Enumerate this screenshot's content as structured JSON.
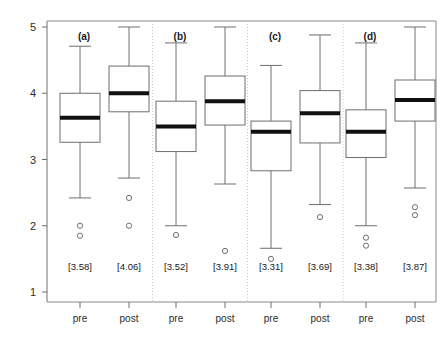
{
  "chart_data": {
    "type": "box",
    "title": "",
    "xlabel": "",
    "ylabel": "",
    "ylim": [
      1,
      5
    ],
    "yticks": [
      1,
      2,
      3,
      4,
      5
    ],
    "ytick_labels": [
      "1",
      "2",
      "3",
      "4",
      "5"
    ],
    "grid": false,
    "legend": "none",
    "panel_labels": [
      "(a)",
      "(b)",
      "(c)",
      "(d)"
    ],
    "x_categories": [
      "pre",
      "post",
      "pre",
      "post",
      "pre",
      "post",
      "pre",
      "post"
    ],
    "mean_labels": [
      "[3.58]",
      "[4.06]",
      "[3.52]",
      "[3.91]",
      "[3.31]",
      "[3.69]",
      "[3.38]",
      "[3.87]"
    ],
    "colors": {
      "box_stroke": "#6e6e6e",
      "median": "#111111",
      "frame": "#8a8a8a",
      "separator": "#c8c8c8",
      "background": "#ffffff"
    },
    "panels": [
      {
        "label": "(a)",
        "boxes": [
          {
            "group": "pre",
            "mean_label": "[3.58]",
            "median": 3.63,
            "q1": 3.26,
            "q3": 4.0,
            "whisker_low": 2.42,
            "whisker_high": 4.71,
            "outliers": [
              2.0,
              1.85
            ]
          },
          {
            "group": "post",
            "mean_label": "[4.06]",
            "median": 4.0,
            "q1": 3.72,
            "q3": 4.41,
            "whisker_low": 2.72,
            "whisker_high": 5.0,
            "outliers": [
              2.42,
              2.0
            ]
          }
        ]
      },
      {
        "label": "(b)",
        "boxes": [
          {
            "group": "pre",
            "mean_label": "[3.52]",
            "median": 3.5,
            "q1": 3.12,
            "q3": 3.88,
            "whisker_low": 2.0,
            "whisker_high": 4.76,
            "outliers": [
              1.86
            ]
          },
          {
            "group": "post",
            "mean_label": "[3.91]",
            "median": 3.88,
            "q1": 3.52,
            "q3": 4.26,
            "whisker_low": 2.63,
            "whisker_high": 5.0,
            "outliers": [
              1.62
            ]
          }
        ]
      },
      {
        "label": "(c)",
        "boxes": [
          {
            "group": "pre",
            "mean_label": "[3.31]",
            "median": 3.42,
            "q1": 2.83,
            "q3": 3.58,
            "whisker_low": 1.66,
            "whisker_high": 4.42,
            "outliers": [
              1.5
            ]
          },
          {
            "group": "post",
            "mean_label": "[3.69]",
            "median": 3.7,
            "q1": 3.25,
            "q3": 4.04,
            "whisker_low": 2.32,
            "whisker_high": 4.88,
            "outliers": [
              2.13
            ]
          }
        ]
      },
      {
        "label": "(d)",
        "boxes": [
          {
            "group": "pre",
            "mean_label": "[3.38]",
            "median": 3.42,
            "q1": 3.03,
            "q3": 3.75,
            "whisker_low": 2.0,
            "whisker_high": 4.76,
            "outliers": [
              1.82,
              1.7
            ]
          },
          {
            "group": "post",
            "mean_label": "[3.87]",
            "median": 3.9,
            "q1": 3.58,
            "q3": 4.2,
            "whisker_low": 2.57,
            "whisker_high": 5.0,
            "outliers": [
              2.28,
              2.16
            ]
          }
        ]
      }
    ]
  }
}
